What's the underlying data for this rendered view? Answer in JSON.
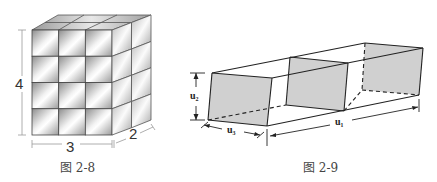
{
  "figures": [
    {
      "id": "fig-2-8",
      "caption": "图 2-8",
      "description": "Rectangular box built from unit cubes",
      "dimensions": {
        "height": "4",
        "width": "3",
        "depth": "2"
      },
      "grid": {
        "rows": 4,
        "cols": 3,
        "depth": 2
      }
    },
    {
      "id": "fig-2-9",
      "caption": "图 2-9",
      "description": "Long prism with cross sections",
      "labels": {
        "height": "u₂",
        "width": "u₃",
        "length": "u₁"
      }
    }
  ],
  "colors": {
    "line": "#222222",
    "shade": "#d0d0d0",
    "cube_light": "#f4f4f4",
    "cube_dark": "#8a8a8a"
  }
}
